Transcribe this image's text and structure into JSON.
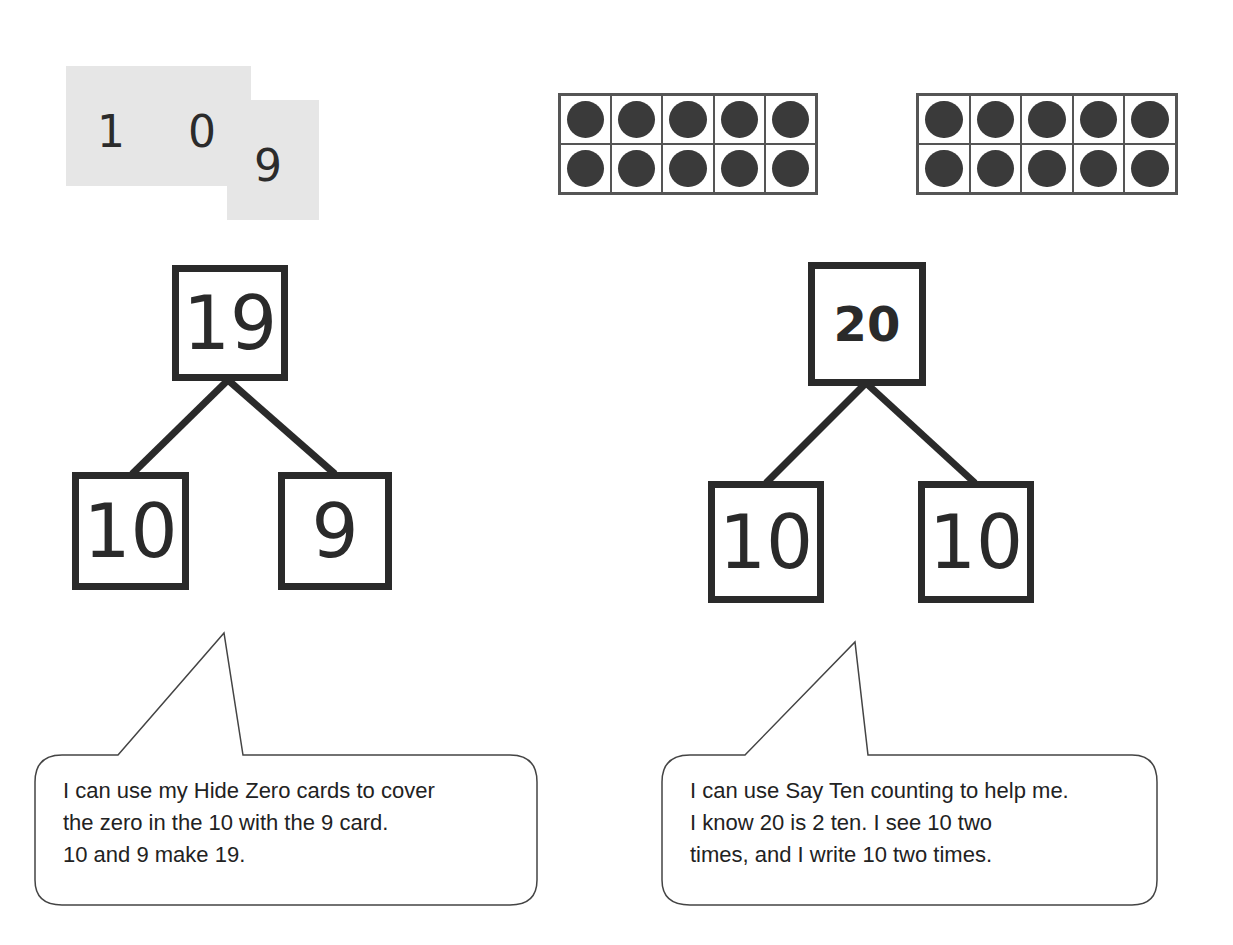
{
  "hide_zero_cards": {
    "card_tens": {
      "digit_1": "1",
      "digit_2": "0"
    },
    "card_ones": {
      "digit": "9"
    }
  },
  "ten_frames": {
    "count": 2,
    "dots_per_frame": 10,
    "dot_color": "#3a3a3a"
  },
  "left_bond": {
    "whole": "19",
    "part_left": "10",
    "part_right": "9"
  },
  "right_bond": {
    "whole": "20",
    "part_left": "10",
    "part_right": "10"
  },
  "left_callout": {
    "text": "I can use my Hide Zero cards to cover\nthe zero in the 10 with the 9 card.\n10 and 9 make 19."
  },
  "right_callout": {
    "text": "I can use Say Ten counting to help me.\nI know 20 is 2 ten.  I see 10 two\ntimes, and I write 10 two times."
  }
}
